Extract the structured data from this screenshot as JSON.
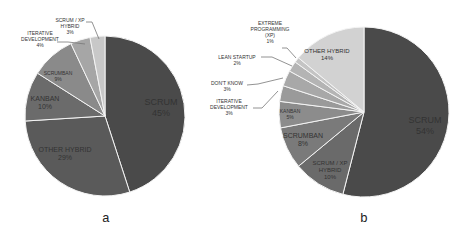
{
  "chart_data": [
    {
      "type": "pie",
      "title": "",
      "caption": "a",
      "categories": [
        "SCRUM",
        "OTHER HYBRID",
        "KANBAN",
        "SCRUMBAN",
        "ITERATIVE DEVELOPMENT",
        "SCRUM / XP HYBRID"
      ],
      "values": [
        45,
        29,
        10,
        9,
        4,
        3
      ],
      "labels": [
        "SCRUM 45%",
        "OTHER HYBRID 29%",
        "KANBAN 10%",
        "SCRUMBAN 9%",
        "ITERATIVE DEVELOPMENT 4%",
        "SCRUM / XP HYBRID 3%"
      ],
      "colors": [
        "#4a4a4a",
        "#5a5a5a",
        "#6b6b6b",
        "#8a8a8a",
        "#a6a6a6",
        "#c8c8c8"
      ],
      "legend": "none"
    },
    {
      "type": "pie",
      "title": "",
      "caption": "b",
      "categories": [
        "SCRUM",
        "SCRUM / XP HYBRID",
        "SCRUMBAN",
        "KANBAN",
        "ITERATIVE DEVELOPMENT",
        "DON'T KNOW",
        "LEAN STARTUP",
        "EXTREME PROGRAMMING (XP)",
        "OTHER HYBRID"
      ],
      "values": [
        54,
        10,
        8,
        5,
        3,
        3,
        2,
        1,
        14
      ],
      "labels": [
        "SCRUM 54%",
        "SCRUM / XP HYBRID 10%",
        "SCRUMBAN 8%",
        "KANBAN 5%",
        "ITERATIVE DEVELOPMENT 3%",
        "DON'T KNOW 3%",
        "LEAN STARTUP 2%",
        "EXTREME PROGRAMMING (XP) 1%",
        "OTHER HYBRID 14%"
      ],
      "colors": [
        "#4a4a4a",
        "#6a6a6a",
        "#7a7a7a",
        "#8c8c8c",
        "#9a9a9a",
        "#a8a8a8",
        "#b4b4b4",
        "#c4c4c4",
        "#d2d2d2"
      ],
      "legend": "none"
    }
  ],
  "captions": {
    "a": "a",
    "b": "b"
  }
}
